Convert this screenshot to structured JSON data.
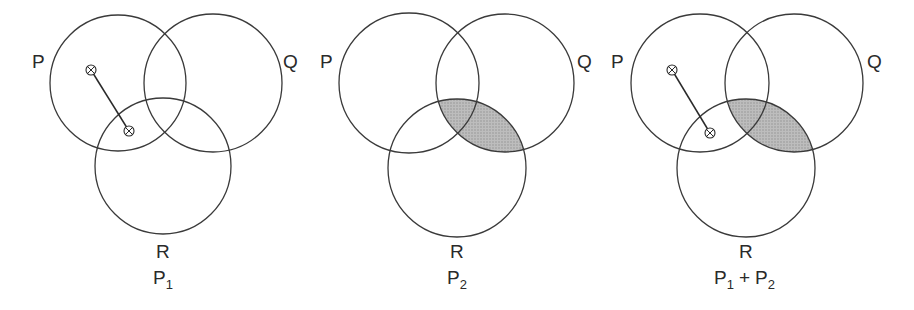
{
  "panels": [
    {
      "id": "p1",
      "caption": {
        "main": "P",
        "sub": "1",
        "full": "P1"
      },
      "sets": {
        "P": "P",
        "Q": "Q",
        "R": "R"
      },
      "circles": {
        "P": {
          "cx": 118,
          "cy": 83,
          "r": 68
        },
        "Q": {
          "cx": 213,
          "cy": 83,
          "r": 69
        },
        "R": {
          "cx": 163,
          "cy": 166,
          "r": 68
        }
      },
      "shaded_region": null,
      "link": {
        "from": [
          91,
          70
        ],
        "to": [
          129,
          131
        ],
        "description": "element in P only linked to element in P∩R (not Q)"
      }
    },
    {
      "id": "p2",
      "caption": {
        "main": "P",
        "sub": "2",
        "full": "P2"
      },
      "sets": {
        "P": "P",
        "Q": "Q",
        "R": "R"
      },
      "circles": {
        "P": {
          "cx": 409,
          "cy": 83,
          "r": 70
        },
        "Q": {
          "cx": 505,
          "cy": 83,
          "r": 69
        },
        "R": {
          "cx": 457,
          "cy": 168,
          "r": 69
        }
      },
      "shaded_region": "Q ∩ R",
      "link": null
    },
    {
      "id": "p3",
      "caption": {
        "main": "P",
        "sub": "1",
        "plus": "+",
        "main2": "P",
        "sub2": "2",
        "full": "P1 + P2"
      },
      "sets": {
        "P": "P",
        "Q": "Q",
        "R": "R"
      },
      "circles": {
        "P": {
          "cx": 700,
          "cy": 83,
          "r": 69
        },
        "Q": {
          "cx": 794,
          "cy": 83,
          "r": 69
        },
        "R": {
          "cx": 746,
          "cy": 168,
          "r": 69
        }
      },
      "shaded_region": "Q ∩ R",
      "link": {
        "from": [
          672,
          70
        ],
        "to": [
          710,
          133
        ],
        "description": "element in P only linked to element in P∩R (not Q)"
      }
    }
  ],
  "colors": {
    "stroke": "#3a3a3a",
    "shade": "#b4b4b4",
    "text": "#2a2a2a",
    "background": "#ffffff"
  }
}
